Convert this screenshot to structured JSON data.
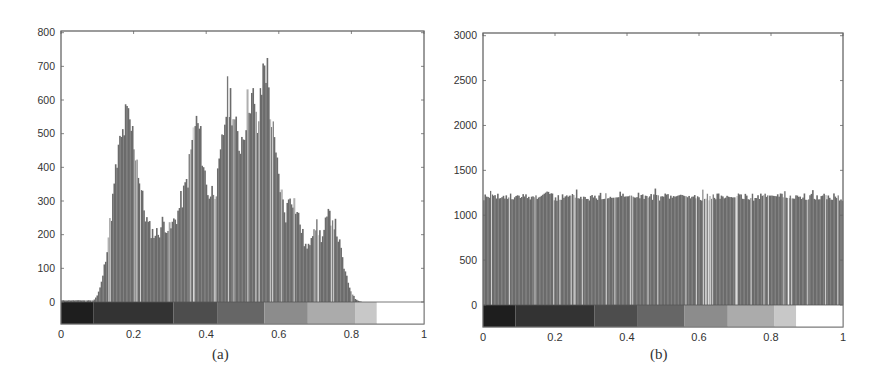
{
  "figure": {
    "panels": [
      {
        "id": "a",
        "caption": "(a)"
      },
      {
        "id": "b",
        "caption": "(b)"
      }
    ]
  },
  "chart_data": [
    {
      "type": "bar",
      "subtype": "histogram",
      "title": "",
      "caption": "(a)",
      "xlabel": "",
      "ylabel": "",
      "xlim": [
        0,
        1
      ],
      "ylim": [
        -70,
        800
      ],
      "xticks": [
        "0",
        "0.2",
        "0.4",
        "0.6",
        "0.8",
        "1"
      ],
      "yticks": [
        "0",
        "100",
        "200",
        "300",
        "400",
        "500",
        "600",
        "700",
        "800"
      ],
      "grid": false,
      "legend": null,
      "colorbar": {
        "position": "below zero line",
        "segments": [
          {
            "from": 0.0,
            "to": 0.09,
            "color": "#1e1e1e"
          },
          {
            "from": 0.09,
            "to": 0.31,
            "color": "#333333"
          },
          {
            "from": 0.31,
            "to": 0.43,
            "color": "#4d4d4d"
          },
          {
            "from": 0.43,
            "to": 0.56,
            "color": "#666666"
          },
          {
            "from": 0.56,
            "to": 0.68,
            "color": "#8c8c8c"
          },
          {
            "from": 0.68,
            "to": 0.81,
            "color": "#ababab"
          },
          {
            "from": 0.81,
            "to": 0.87,
            "color": "#c8c8c8"
          },
          {
            "from": 0.87,
            "to": 1.0,
            "color": "#ffffff"
          }
        ]
      },
      "x": [
        0.09,
        0.1,
        0.11,
        0.12,
        0.13,
        0.14,
        0.15,
        0.16,
        0.17,
        0.18,
        0.19,
        0.2,
        0.21,
        0.22,
        0.23,
        0.24,
        0.25,
        0.26,
        0.27,
        0.28,
        0.29,
        0.3,
        0.31,
        0.32,
        0.33,
        0.34,
        0.35,
        0.36,
        0.37,
        0.38,
        0.39,
        0.4,
        0.41,
        0.42,
        0.43,
        0.44,
        0.45,
        0.46,
        0.47,
        0.48,
        0.49,
        0.5,
        0.51,
        0.52,
        0.53,
        0.54,
        0.55,
        0.56,
        0.57,
        0.58,
        0.59,
        0.6,
        0.61,
        0.62,
        0.63,
        0.64,
        0.65,
        0.66,
        0.67,
        0.68,
        0.69,
        0.7,
        0.71,
        0.72,
        0.73,
        0.74,
        0.75,
        0.76,
        0.77,
        0.78,
        0.79,
        0.8,
        0.81,
        0.82,
        0.83,
        0.84,
        0.85,
        0.86,
        0.87,
        0.88,
        0.89
      ],
      "values": [
        5,
        20,
        50,
        110,
        190,
        280,
        380,
        460,
        500,
        560,
        530,
        490,
        420,
        340,
        270,
        230,
        210,
        205,
        210,
        240,
        230,
        215,
        240,
        260,
        300,
        330,
        380,
        470,
        540,
        520,
        440,
        350,
        320,
        340,
        350,
        430,
        540,
        620,
        600,
        520,
        470,
        500,
        560,
        630,
        600,
        510,
        600,
        740,
        670,
        540,
        440,
        380,
        300,
        260,
        330,
        310,
        270,
        230,
        180,
        150,
        210,
        240,
        210,
        190,
        240,
        260,
        250,
        210,
        160,
        100,
        60,
        30,
        10,
        3,
        0,
        0,
        0,
        0,
        0,
        0,
        0
      ],
      "bar_color": "#6b6b6b"
    },
    {
      "type": "bar",
      "subtype": "histogram",
      "title": "",
      "caption": "(b)",
      "xlabel": "",
      "ylabel": "",
      "xlim": [
        0,
        1
      ],
      "ylim": [
        -250,
        3000
      ],
      "xticks": [
        "0",
        "0.2",
        "0.4",
        "0.6",
        "0.8",
        "1"
      ],
      "yticks": [
        "0",
        "500",
        "1000",
        "1500",
        "2000",
        "2500",
        "3000"
      ],
      "grid": false,
      "legend": null,
      "colorbar": {
        "position": "below zero line",
        "segments": [
          {
            "from": 0.0,
            "to": 0.09,
            "color": "#1e1e1e"
          },
          {
            "from": 0.09,
            "to": 0.31,
            "color": "#333333"
          },
          {
            "from": 0.31,
            "to": 0.43,
            "color": "#4d4d4d"
          },
          {
            "from": 0.43,
            "to": 0.56,
            "color": "#666666"
          },
          {
            "from": 0.56,
            "to": 0.68,
            "color": "#8c8c8c"
          },
          {
            "from": 0.68,
            "to": 0.81,
            "color": "#ababab"
          },
          {
            "from": 0.81,
            "to": 0.87,
            "color": "#c8c8c8"
          },
          {
            "from": 0.87,
            "to": 1.0,
            "color": "#ffffff"
          }
        ]
      },
      "description": "Approximately uniform (equalized) histogram with bins ~1200 across full range 0–1, max spike ~1310 near 0.18",
      "x": [
        0.0,
        0.05,
        0.1,
        0.15,
        0.18,
        0.2,
        0.25,
        0.3,
        0.35,
        0.4,
        0.45,
        0.5,
        0.55,
        0.6,
        0.65,
        0.7,
        0.75,
        0.8,
        0.85,
        0.9,
        0.95,
        1.0
      ],
      "values": [
        1200,
        1230,
        1210,
        1220,
        1310,
        1190,
        1240,
        1200,
        1230,
        1250,
        1220,
        1200,
        1270,
        1190,
        1220,
        1240,
        1200,
        1260,
        1230,
        1210,
        1220,
        1200
      ],
      "typical_value": 1200,
      "bar_color": "#6b6b6b"
    }
  ]
}
